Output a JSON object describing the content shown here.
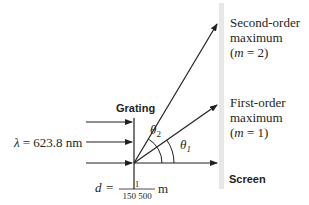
{
  "diagram": {
    "labels": {
      "grating": "Grating",
      "screen": "Screen",
      "wavelength_symbol": "λ",
      "wavelength_eq": "= 623.8 nm",
      "d_symbol": "d",
      "d_eq": "=",
      "d_numerator": "1",
      "d_denominator": "150 500",
      "d_unit": "m",
      "theta2": "θ",
      "theta2_sub": "2",
      "theta1": "θ",
      "theta1_sub": "1",
      "second_order_line1": "Second-order",
      "second_order_line2": "maximum",
      "second_order_m_open": "(",
      "second_order_m": "m",
      "second_order_m_rest": " = 2)",
      "first_order_line1": "First-order",
      "first_order_line2": "maximum",
      "first_order_m_open": "(",
      "first_order_m": "m",
      "first_order_m_rest": " = 1)"
    },
    "colors": {
      "line": "#231f20",
      "screen": "#e6e7e8",
      "background": "#ffffff"
    }
  }
}
